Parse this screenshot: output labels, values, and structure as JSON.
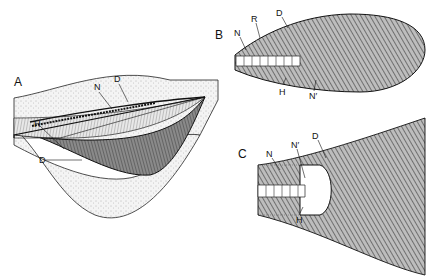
{
  "figure": {
    "panels": [
      {
        "id": "A",
        "label": "A",
        "labels": [
          {
            "text": "N",
            "x": 94,
            "y": 83
          },
          {
            "text": "D",
            "x": 114,
            "y": 75
          },
          {
            "text": "H",
            "x": 34,
            "y": 120
          },
          {
            "text": "D",
            "x": 39,
            "y": 156
          }
        ]
      },
      {
        "id": "B",
        "label": "B",
        "labels": [
          {
            "text": "N",
            "x": 234,
            "y": 29
          },
          {
            "text": "R",
            "x": 251,
            "y": 15
          },
          {
            "text": "D",
            "x": 276,
            "y": 9
          },
          {
            "text": "H",
            "x": 279,
            "y": 88
          },
          {
            "text": "N′",
            "x": 309,
            "y": 92
          }
        ]
      },
      {
        "id": "C",
        "label": "C",
        "labels": [
          {
            "text": "N",
            "x": 266,
            "y": 150
          },
          {
            "text": "N′",
            "x": 291,
            "y": 141
          },
          {
            "text": "D",
            "x": 312,
            "y": 132
          },
          {
            "text": "H",
            "x": 296,
            "y": 216
          }
        ]
      }
    ],
    "colors": {
      "ink": "#1a1a1a",
      "shade": "#6e6e6e",
      "stipple": "#dcdcdc",
      "background": "#ffffff"
    }
  }
}
